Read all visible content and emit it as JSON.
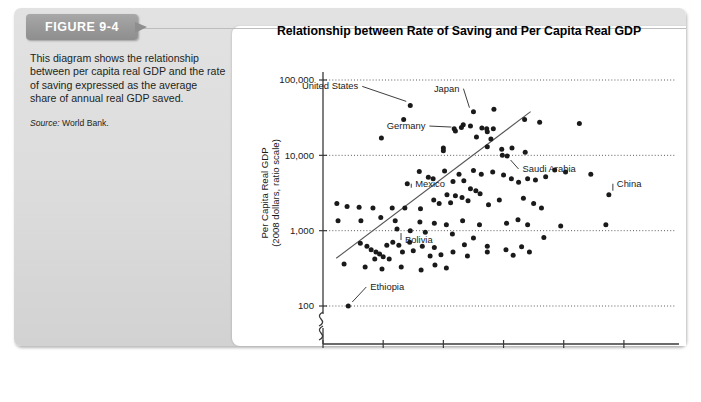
{
  "figure": {
    "tab_label": "FIGURE 9-4",
    "description": "This diagram shows the relationship between per capita real GDP and the rate of saving expressed as the average share of annual real GDP saved.",
    "source_prefix": "Source:",
    "source_text": "World Bank."
  },
  "chart_data": {
    "type": "scatter",
    "title": "Relationship between Rate of Saving and Per Capita Real GDP",
    "xlabel": "Gross Domestic Saving as a Percentage of Real GDP",
    "ylabel": "Per Capita Real GDP\n(2008 dollars, ratio scale)",
    "ylabel_line1": "Per Capita Real GDP",
    "ylabel_line2": "(2008 dollars, ratio scale)",
    "yscale": "log",
    "ylim": [
      100,
      100000
    ],
    "xlim": [
      0,
      55
    ],
    "xticks": [
      0,
      10,
      20,
      30,
      40,
      50
    ],
    "xticklabels": [
      "0",
      "10",
      "20",
      "30",
      "40",
      "50"
    ],
    "yticks": [
      100,
      1000,
      10000,
      100000
    ],
    "yticklabels": [
      "100",
      "1,000",
      "10,000",
      "100,000"
    ],
    "grid": "horizontal-dotted",
    "axis_break": true,
    "legend": "none",
    "trendline": {
      "x0": 2.2,
      "y0": 430,
      "x1": 34.5,
      "y1": 38000
    },
    "annotations": [
      {
        "label": "United States",
        "x": 14.5,
        "y": 46000
      },
      {
        "label": "Japan",
        "x": 25.0,
        "y": 38000
      },
      {
        "label": "Germany",
        "x": 22.0,
        "y": 21000
      },
      {
        "label": "Saudi Arabia",
        "x": 30.5,
        "y": 9800
      },
      {
        "label": "China",
        "x": 47.5,
        "y": 3000
      },
      {
        "label": "Mexico",
        "x": 14.0,
        "y": 4200
      },
      {
        "label": "Bolivia",
        "x": 12.3,
        "y": 1050
      },
      {
        "label": "Ethiopia",
        "x": 4.2,
        "y": 100
      }
    ],
    "points": [
      {
        "x": 14.5,
        "y": 46000
      },
      {
        "x": 13.4,
        "y": 30000
      },
      {
        "x": 25.0,
        "y": 38000
      },
      {
        "x": 23.3,
        "y": 25500
      },
      {
        "x": 28.4,
        "y": 41000
      },
      {
        "x": 21.8,
        "y": 22500
      },
      {
        "x": 23.0,
        "y": 23500
      },
      {
        "x": 24.5,
        "y": 24500
      },
      {
        "x": 26.4,
        "y": 23000
      },
      {
        "x": 27.2,
        "y": 22500
      },
      {
        "x": 27.3,
        "y": 20500
      },
      {
        "x": 28.3,
        "y": 22500
      },
      {
        "x": 22.0,
        "y": 21000
      },
      {
        "x": 25.5,
        "y": 17500
      },
      {
        "x": 27.9,
        "y": 16500
      },
      {
        "x": 9.7,
        "y": 17000
      },
      {
        "x": 20.0,
        "y": 12500
      },
      {
        "x": 20.0,
        "y": 11500
      },
      {
        "x": 27.3,
        "y": 13000
      },
      {
        "x": 33.5,
        "y": 30000
      },
      {
        "x": 36.0,
        "y": 27500
      },
      {
        "x": 42.6,
        "y": 26500
      },
      {
        "x": 30.6,
        "y": 9800
      },
      {
        "x": 31.4,
        "y": 12500
      },
      {
        "x": 29.7,
        "y": 12000
      },
      {
        "x": 33.6,
        "y": 11000
      },
      {
        "x": 40.3,
        "y": 6000
      },
      {
        "x": 44.5,
        "y": 5600
      },
      {
        "x": 37.0,
        "y": 5200
      },
      {
        "x": 29.8,
        "y": 10000
      },
      {
        "x": 16.0,
        "y": 6100
      },
      {
        "x": 17.5,
        "y": 5100
      },
      {
        "x": 18.3,
        "y": 4900
      },
      {
        "x": 14.0,
        "y": 4200
      },
      {
        "x": 20.2,
        "y": 6200
      },
      {
        "x": 21.6,
        "y": 4500
      },
      {
        "x": 22.6,
        "y": 5600
      },
      {
        "x": 23.4,
        "y": 4600
      },
      {
        "x": 25.0,
        "y": 6300
      },
      {
        "x": 26.3,
        "y": 5600
      },
      {
        "x": 24.5,
        "y": 3600
      },
      {
        "x": 25.4,
        "y": 3400
      },
      {
        "x": 28.2,
        "y": 6000
      },
      {
        "x": 30.0,
        "y": 5500
      },
      {
        "x": 31.3,
        "y": 4900
      },
      {
        "x": 32.5,
        "y": 4400
      },
      {
        "x": 34.0,
        "y": 4900
      },
      {
        "x": 35.3,
        "y": 4700
      },
      {
        "x": 38.5,
        "y": 6400
      },
      {
        "x": 20.6,
        "y": 3000
      },
      {
        "x": 22.0,
        "y": 2900
      },
      {
        "x": 23.1,
        "y": 2750
      },
      {
        "x": 18.4,
        "y": 2550
      },
      {
        "x": 19.3,
        "y": 2300
      },
      {
        "x": 21.2,
        "y": 2350
      },
      {
        "x": 24.1,
        "y": 2500
      },
      {
        "x": 26.1,
        "y": 3100
      },
      {
        "x": 27.5,
        "y": 2200
      },
      {
        "x": 29.3,
        "y": 2550
      },
      {
        "x": 33.3,
        "y": 2700
      },
      {
        "x": 35.0,
        "y": 2300
      },
      {
        "x": 36.3,
        "y": 2000
      },
      {
        "x": 47.5,
        "y": 3000
      },
      {
        "x": 2.3,
        "y": 2300
      },
      {
        "x": 4.0,
        "y": 2100
      },
      {
        "x": 6.0,
        "y": 2050
      },
      {
        "x": 8.3,
        "y": 2000
      },
      {
        "x": 11.5,
        "y": 2000
      },
      {
        "x": 13.6,
        "y": 2000
      },
      {
        "x": 16.2,
        "y": 1950
      },
      {
        "x": 2.5,
        "y": 1350
      },
      {
        "x": 6.3,
        "y": 1350
      },
      {
        "x": 9.6,
        "y": 1500
      },
      {
        "x": 12.0,
        "y": 1350
      },
      {
        "x": 16.1,
        "y": 1300
      },
      {
        "x": 18.5,
        "y": 1250
      },
      {
        "x": 20.5,
        "y": 1200
      },
      {
        "x": 23.2,
        "y": 1350
      },
      {
        "x": 26.0,
        "y": 1200
      },
      {
        "x": 30.5,
        "y": 1250
      },
      {
        "x": 32.4,
        "y": 1400
      },
      {
        "x": 34.0,
        "y": 1200
      },
      {
        "x": 36.7,
        "y": 810
      },
      {
        "x": 39.5,
        "y": 1150
      },
      {
        "x": 12.3,
        "y": 1050
      },
      {
        "x": 14.5,
        "y": 1000
      },
      {
        "x": 17.0,
        "y": 950
      },
      {
        "x": 21.5,
        "y": 900
      },
      {
        "x": 25.0,
        "y": 800
      },
      {
        "x": 47.0,
        "y": 1200
      },
      {
        "x": 6.2,
        "y": 680
      },
      {
        "x": 7.3,
        "y": 620
      },
      {
        "x": 8.0,
        "y": 560
      },
      {
        "x": 8.8,
        "y": 520
      },
      {
        "x": 9.4,
        "y": 490
      },
      {
        "x": 10.6,
        "y": 640
      },
      {
        "x": 11.6,
        "y": 700
      },
      {
        "x": 12.6,
        "y": 640
      },
      {
        "x": 13.2,
        "y": 520
      },
      {
        "x": 14.4,
        "y": 700
      },
      {
        "x": 15.0,
        "y": 540
      },
      {
        "x": 16.5,
        "y": 620
      },
      {
        "x": 17.8,
        "y": 460
      },
      {
        "x": 18.5,
        "y": 600
      },
      {
        "x": 19.6,
        "y": 480
      },
      {
        "x": 21.6,
        "y": 520
      },
      {
        "x": 23.5,
        "y": 650
      },
      {
        "x": 24.0,
        "y": 460
      },
      {
        "x": 27.3,
        "y": 620
      },
      {
        "x": 27.3,
        "y": 520
      },
      {
        "x": 30.4,
        "y": 560
      },
      {
        "x": 31.6,
        "y": 470
      },
      {
        "x": 33.0,
        "y": 610
      },
      {
        "x": 34.3,
        "y": 520
      },
      {
        "x": 3.5,
        "y": 360
      },
      {
        "x": 7.0,
        "y": 330
      },
      {
        "x": 9.8,
        "y": 310
      },
      {
        "x": 11.0,
        "y": 420
      },
      {
        "x": 13.0,
        "y": 330
      },
      {
        "x": 16.3,
        "y": 300
      },
      {
        "x": 18.6,
        "y": 350
      },
      {
        "x": 20.5,
        "y": 320
      },
      {
        "x": 8.6,
        "y": 420
      },
      {
        "x": 10.0,
        "y": 450
      },
      {
        "x": 4.2,
        "y": 100
      }
    ]
  }
}
